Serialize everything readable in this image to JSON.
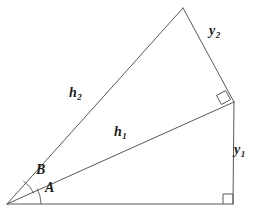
{
  "figure": {
    "background_color": "#ffffff",
    "stroke_color": "#58585a",
    "text_color": "#1b1b1b",
    "width": 257,
    "height": 217,
    "labels": {
      "h1": {
        "base": "h",
        "sub": "1",
        "x": 114,
        "y": 125
      },
      "h2": {
        "base": "h",
        "sub": "2",
        "x": 69,
        "y": 86
      },
      "y1": {
        "base": "y",
        "sub": "1",
        "x": 234,
        "y": 143
      },
      "y2": {
        "base": "y",
        "sub": "2",
        "x": 209,
        "y": 24
      },
      "angle_a": {
        "text": "A",
        "x": 45,
        "y": 181
      },
      "angle_b": {
        "text": "B",
        "x": 36,
        "y": 163
      }
    },
    "vertices": {
      "origin": {
        "x": 7,
        "y": 204
      },
      "bottom_right": {
        "x": 233,
        "y": 204
      },
      "mid_right": {
        "x": 234,
        "y": 102
      },
      "top_apex": {
        "x": 183,
        "y": 8
      }
    },
    "segments": [
      {
        "name": "base",
        "x1": 7,
        "y1": 204,
        "x2": 233,
        "y2": 204
      },
      {
        "name": "y1-vertical",
        "x1": 233,
        "y1": 204,
        "x2": 234,
        "y2": 102
      },
      {
        "name": "h1-hypotenuse",
        "x1": 7,
        "y1": 204,
        "x2": 234,
        "y2": 102
      },
      {
        "name": "h2-hypotenuse",
        "x1": 7,
        "y1": 204,
        "x2": 183,
        "y2": 8
      },
      {
        "name": "y2-side",
        "x1": 183,
        "y1": 8,
        "x2": 234,
        "y2": 102
      }
    ],
    "right_angle_markers": [
      {
        "name": "bottom-right-angle",
        "points": "223,204 223,194 233,194 233,204"
      },
      {
        "name": "mid-right-angle",
        "points": "225.6,90.6 216.5,95.5 221.5,104.5 230.6,99.6"
      }
    ],
    "angle_arcs": [
      {
        "name": "angle-a-arc",
        "d": "M 41 204 A 34 34 0 0 0 37.2 188.7"
      },
      {
        "name": "angle-b-arc",
        "d": "M 34 193.5 A 31 31 0 0 0 23.4 181.1"
      }
    ]
  }
}
